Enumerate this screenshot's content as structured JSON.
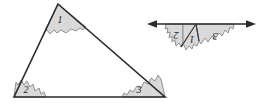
{
  "figure": {
    "colors": {
      "patch_fill": "#d9d9d9",
      "patch_stroke": "#8c8c8c",
      "triangle_stroke": "#2b2b2b",
      "line_stroke": "#2b2b2b",
      "label_color": "#1a1a1a",
      "background": "#ffffff"
    },
    "triangle": {
      "name": "triangle",
      "vertices": {
        "apex": [
          58,
          4
        ],
        "bottom_left": [
          14,
          97
        ],
        "bottom_right": [
          165,
          97
        ]
      },
      "angle_patches": [
        {
          "id": "angle-1",
          "label": "1",
          "label_x": 60,
          "label_y": 22,
          "rotated": false
        },
        {
          "id": "angle-2",
          "label": "2",
          "label_x": 26,
          "label_y": 92,
          "rotated": false
        },
        {
          "id": "angle-3",
          "label": "3",
          "label_x": 139,
          "label_y": 92,
          "rotated": false
        }
      ]
    },
    "straight_line": {
      "name": "straight-angle-line",
      "y": 24,
      "x_start": 148,
      "x_end": 255,
      "left_arrow": "left-arrowhead",
      "right_arrow": "right-arrowhead"
    },
    "rearranged_patches": [
      {
        "id": "rearranged-angle-2",
        "label": "2",
        "label_x": 176,
        "label_y": 35,
        "rotated": true
      },
      {
        "id": "rearranged-angle-1",
        "label": "1",
        "label_x": 192,
        "label_y": 39,
        "rotated": true
      },
      {
        "id": "rearranged-angle-3",
        "label": "3",
        "label_x": 215,
        "label_y": 36,
        "rotated": true
      }
    ]
  }
}
